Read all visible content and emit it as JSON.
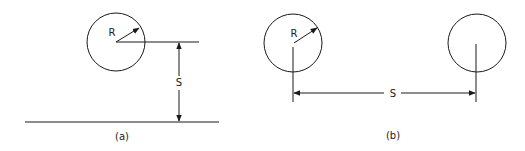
{
  "colors": {
    "line": "#1a1a1a",
    "background": "#ffffff"
  },
  "panel_a": {
    "caption": "(a)",
    "radius_label": "R",
    "distance_label": "S",
    "circle": {
      "cx": 116,
      "cy": 42,
      "r": 29
    },
    "ground_line": {
      "x1": 25,
      "x2": 219,
      "y": 122
    },
    "center_line": {
      "x1": 116,
      "x2": 199,
      "y": 42
    },
    "dimension_x": 179
  },
  "panel_b": {
    "caption": "(b)",
    "radius_label": "R",
    "distance_label": "S",
    "circle_left": {
      "cx": 293,
      "cy": 43,
      "r": 29
    },
    "circle_right": {
      "cx": 477,
      "cy": 43,
      "r": 29
    },
    "dimension_y": 93
  }
}
